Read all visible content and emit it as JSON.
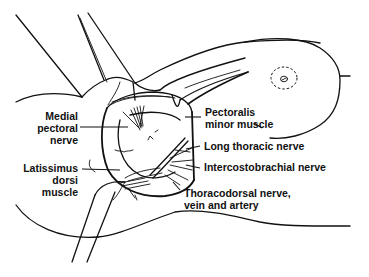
{
  "diagram": {
    "colors": {
      "line": "#111111",
      "background": "#ffffff"
    },
    "labels": {
      "medial_pectoral_nerve": "Medial\npectoral\nnerve",
      "latissimus_dorsi_muscle": "Latissimus\ndorsi\nmuscle",
      "pectoralis_minor_muscle": "Pectoralis\nminor muscle",
      "long_thoracic_nerve": "Long thoracic nerve",
      "intercostobrachial_nerve": "Intercostobrachial nerve",
      "thoracodorsal_bundle": "Thoracodorsal nerve,\nvein and artery"
    },
    "features": [
      "raised-arm",
      "retractors",
      "surgical-field",
      "breast-outline",
      "nipple-areola-dashed"
    ]
  }
}
